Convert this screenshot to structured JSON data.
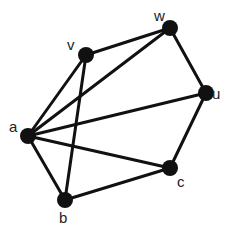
{
  "diagram": {
    "type": "graph",
    "colors": {
      "node": "#111111",
      "edge": "#111111",
      "label": "#222222",
      "background": "#ffffff"
    },
    "nodes": [
      {
        "id": "w",
        "label": "w",
        "x": 170,
        "y": 28,
        "lx": 154,
        "ly": 21
      },
      {
        "id": "v",
        "label": "v",
        "x": 86,
        "y": 55,
        "lx": 67,
        "ly": 50
      },
      {
        "id": "u",
        "label": "u",
        "x": 206,
        "y": 93,
        "lx": 212,
        "ly": 99
      },
      {
        "id": "a",
        "label": "a",
        "x": 28,
        "y": 136,
        "lx": 9,
        "ly": 132
      },
      {
        "id": "c",
        "label": "c",
        "x": 170,
        "y": 168,
        "lx": 177,
        "ly": 187
      },
      {
        "id": "b",
        "label": "b",
        "x": 65,
        "y": 200,
        "lx": 59,
        "ly": 223
      }
    ],
    "edges": [
      [
        "v",
        "w"
      ],
      [
        "w",
        "u"
      ],
      [
        "u",
        "c"
      ],
      [
        "c",
        "b"
      ],
      [
        "b",
        "a"
      ],
      [
        "a",
        "v"
      ],
      [
        "a",
        "w"
      ],
      [
        "a",
        "u"
      ],
      [
        "a",
        "c"
      ],
      [
        "v",
        "b"
      ]
    ]
  }
}
